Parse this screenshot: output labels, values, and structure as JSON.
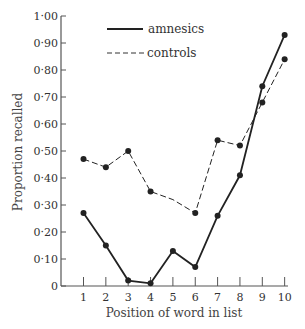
{
  "chart_data": {
    "type": "line",
    "title": "",
    "xlabel": "Position of word in list",
    "ylabel": "Proportion recalled",
    "x": [
      1,
      2,
      3,
      4,
      5,
      6,
      7,
      8,
      9,
      10
    ],
    "x_tick_labels": [
      "1",
      "2",
      "3",
      "4",
      "5",
      "6",
      "7",
      "8",
      "9",
      "10"
    ],
    "y_tick_labels": [
      "0",
      "0·10",
      "0·20",
      "0·30",
      "0·40",
      "0·50",
      "0·60",
      "0·70",
      "0·80",
      "0·90",
      "1·00"
    ],
    "y_ticks": [
      0,
      0.1,
      0.2,
      0.3,
      0.4,
      0.5,
      0.6,
      0.7,
      0.8,
      0.9,
      1.0
    ],
    "ylim": [
      0,
      1.0
    ],
    "xlim": [
      0.2,
      10.1
    ],
    "grid": false,
    "legend_position": "top-center",
    "series": [
      {
        "name": "amnesics",
        "style": "solid",
        "values": [
          0.27,
          0.15,
          0.02,
          0.01,
          0.13,
          0.07,
          0.26,
          0.41,
          0.74,
          0.93
        ],
        "markers": [
          true,
          true,
          true,
          true,
          true,
          true,
          true,
          true,
          true,
          true
        ]
      },
      {
        "name": "controls",
        "style": "dashed",
        "values": [
          0.47,
          0.44,
          0.5,
          0.35,
          0.32,
          0.27,
          0.54,
          0.52,
          0.68,
          0.84
        ],
        "markers": [
          true,
          true,
          true,
          true,
          false,
          true,
          true,
          true,
          true,
          true
        ]
      }
    ],
    "colors": {
      "line": "#222222",
      "axis": "#555555"
    }
  },
  "legend": {
    "items": [
      {
        "label": "amnesics",
        "style": "solid"
      },
      {
        "label": "controls",
        "style": "dashed"
      }
    ]
  }
}
